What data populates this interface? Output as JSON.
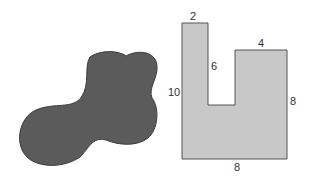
{
  "figure": {
    "blob": {
      "fill": "#5b5b5b",
      "stroke": "#3c3c3c"
    },
    "polygon": {
      "fill": "#c8c8c8",
      "stroke": "#555555",
      "labels": {
        "top_left_width": "2",
        "top_right_width": "4",
        "notch_depth": "6",
        "left_height": "10",
        "right_height": "8",
        "bottom_width": "8"
      }
    }
  }
}
